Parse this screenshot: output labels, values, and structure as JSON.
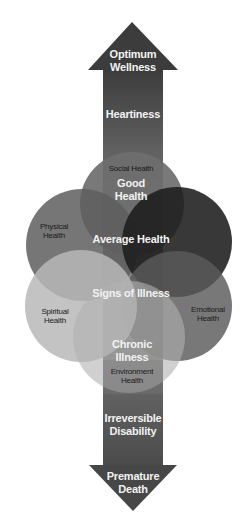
{
  "diagram": {
    "arrow": {
      "top_label": "Optimum\nWellness",
      "bottom_label": "Premature\nDeath",
      "color_top": "#3c3c3c",
      "color_mid": "#8a8a8a",
      "color_bottom": "#4a4a4a"
    },
    "continuum_stages": [
      {
        "id": "heartiness",
        "label": "Heartiness"
      },
      {
        "id": "good-health",
        "label": "Good\nHealth"
      },
      {
        "id": "average-health",
        "label": "Average Health"
      },
      {
        "id": "signs-of-illness",
        "label": "Signs of Illness"
      },
      {
        "id": "chronic-illness",
        "label": "Chronic\nIllness"
      },
      {
        "id": "irreversible-disability",
        "label": "Irreversible\nDisability"
      }
    ],
    "dimensions": [
      {
        "id": "social",
        "label": "Social Health",
        "fill": "#6e6e6e"
      },
      {
        "id": "physical",
        "label": "Physical\nHealth",
        "fill": "#6a6a6a"
      },
      {
        "id": "intellectual",
        "label": "Intellectual\nHealth",
        "fill": "#262626"
      },
      {
        "id": "spiritual",
        "label": "Spiritual\nHealth",
        "fill": "#b4b4b4"
      },
      {
        "id": "emotional",
        "label": "Emotional\nHealth",
        "fill": "#5a5a5a"
      },
      {
        "id": "environment",
        "label": "Environment\nHealth",
        "fill": "#a8a8a8"
      }
    ]
  }
}
